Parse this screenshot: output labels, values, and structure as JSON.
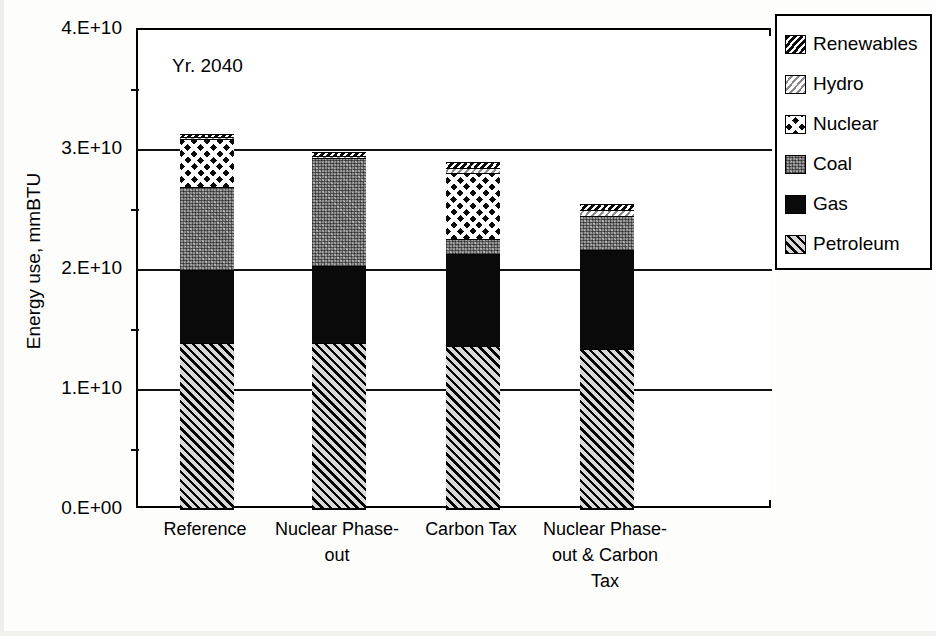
{
  "chart_data": {
    "type": "bar",
    "stacked": true,
    "title": "",
    "annotation": "Yr. 2040",
    "xlabel": "",
    "ylabel": "Energy use, mmBTU",
    "categories": [
      "Reference",
      "Nuclear Phase-out",
      "Carbon Tax",
      "Nuclear Phase-out & Carbon Tax"
    ],
    "category_lines": [
      [
        "Reference"
      ],
      [
        "Nuclear Phase-",
        "out"
      ],
      [
        "Carbon Tax"
      ],
      [
        "Nuclear Phase-",
        "out & Carbon",
        "Tax"
      ]
    ],
    "series": [
      {
        "name": "Petroleum",
        "values": [
          13900000000.0,
          13900000000.0,
          13700000000.0,
          13400000000.0
        ]
      },
      {
        "name": "Gas",
        "values": [
          6100000000.0,
          6400000000.0,
          7600000000.0,
          8300000000.0
        ]
      },
      {
        "name": "Coal",
        "values": [
          6900000000.0,
          9000000000.0,
          1300000000.0,
          2800000000.0
        ]
      },
      {
        "name": "Nuclear",
        "values": [
          4000000000.0,
          0.0,
          5500000000.0,
          0.0
        ]
      },
      {
        "name": "Hydro",
        "values": [
          200000000.0,
          200000000.0,
          400000000.0,
          500000000.0
        ]
      },
      {
        "name": "Renewables",
        "values": [
          200000000.0,
          300000000.0,
          500000000.0,
          500000000.0
        ]
      }
    ],
    "totals": [
      31300000000.0,
      29800000000.0,
      28900000000.0,
      25500000000.0
    ],
    "ylim": [
      0,
      40000000000.0
    ],
    "ytick_values": [
      0,
      10000000000.0,
      20000000000.0,
      30000000000.0,
      40000000000.0
    ],
    "ytick_labels": [
      "0.E+00",
      "1.E+10",
      "2.E+10",
      "3.E+10",
      "4.E+10"
    ],
    "yminor_values": [
      5000000000.0,
      15000000000.0,
      25000000000.0,
      35000000000.0
    ],
    "grid": true,
    "legend_position": "right"
  },
  "legend": {
    "items": [
      {
        "label": "Renewables",
        "pattern": "f-renewables"
      },
      {
        "label": "Hydro",
        "pattern": "f-hydro"
      },
      {
        "label": "Nuclear",
        "pattern": "f-nuclear"
      },
      {
        "label": "Coal",
        "pattern": "f-coal"
      },
      {
        "label": "Gas",
        "pattern": "f-gas"
      },
      {
        "label": "Petroleum",
        "pattern": "f-petroleum"
      }
    ]
  }
}
